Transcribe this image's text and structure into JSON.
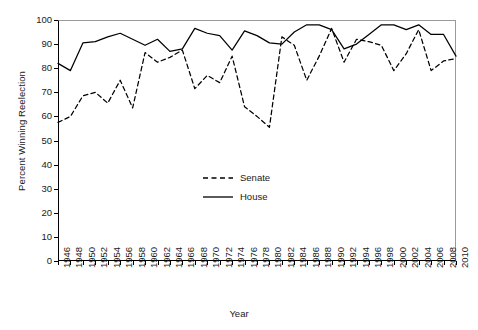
{
  "chart_data": {
    "type": "line",
    "title": "",
    "xlabel": "Year",
    "ylabel": "Percent Winning Reelection",
    "xlim": [
      1946,
      2010
    ],
    "ylim": [
      0,
      100
    ],
    "ytick_step": 10,
    "xtick_step": 2,
    "grid": false,
    "legend_position": "center",
    "x": [
      1946,
      1948,
      1950,
      1952,
      1954,
      1956,
      1958,
      1960,
      1962,
      1964,
      1966,
      1968,
      1970,
      1972,
      1974,
      1976,
      1978,
      1980,
      1982,
      1984,
      1986,
      1988,
      1990,
      1992,
      1994,
      1996,
      1998,
      2000,
      2002,
      2004,
      2006,
      2008,
      2010
    ],
    "yticks": [
      0,
      10,
      20,
      30,
      40,
      50,
      60,
      70,
      80,
      90,
      100
    ],
    "xticks": [
      1946,
      1948,
      1950,
      1952,
      1954,
      1956,
      1958,
      1960,
      1962,
      1964,
      1966,
      1968,
      1970,
      1972,
      1974,
      1976,
      1978,
      1980,
      1982,
      1984,
      1986,
      1988,
      1990,
      1992,
      1994,
      1996,
      1998,
      2000,
      2002,
      2004,
      2006,
      2008,
      2010
    ],
    "series": [
      {
        "name": "Senate",
        "style": "dashed",
        "color": "#000000",
        "values": [
          57.5,
          60,
          68.5,
          70,
          65.5,
          75,
          63.5,
          86.5,
          82.5,
          84.5,
          87.5,
          71.5,
          77,
          74,
          85,
          64,
          60,
          55.5,
          93,
          89.5,
          75,
          85,
          96.5,
          82.5,
          92,
          91,
          89.5,
          79,
          86,
          96,
          79,
          83,
          84
        ]
      },
      {
        "name": "House",
        "style": "solid",
        "color": "#000000",
        "values": [
          82,
          79,
          90.5,
          91,
          93,
          94.5,
          92,
          89.5,
          92,
          87,
          88,
          96.5,
          94.5,
          93.5,
          87.5,
          95.5,
          93.5,
          90.5,
          90,
          95,
          98,
          98,
          96,
          88,
          90,
          94,
          98,
          98,
          96,
          98,
          94,
          94,
          85
        ]
      }
    ],
    "legend": [
      {
        "label": "Senate",
        "style": "dashed"
      },
      {
        "label": "House",
        "style": "solid"
      }
    ]
  }
}
